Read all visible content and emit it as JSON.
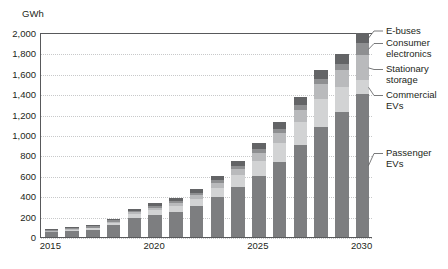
{
  "chart_data": {
    "type": "bar",
    "title": "",
    "subtitle": "",
    "xlabel": "",
    "ylabel": "GWh",
    "unit": "GWh",
    "stacked": true,
    "grid": true,
    "legend_position": "right-callout",
    "ylim": [
      0,
      2000
    ],
    "ytick_step": 200,
    "ytick_labels": [
      "0",
      "200",
      "400",
      "600",
      "800",
      "1,000",
      "1,200",
      "1,400",
      "1,600",
      "1,800",
      "2,000"
    ],
    "ytick_values": [
      0,
      200,
      400,
      600,
      800,
      1000,
      1200,
      1400,
      1600,
      1800,
      2000
    ],
    "categories": [
      "2015",
      "2016",
      "2017",
      "2018",
      "2019",
      "2020",
      "2021",
      "2022",
      "2023",
      "2024",
      "2025",
      "2026",
      "2027",
      "2028",
      "2029",
      "2030"
    ],
    "xtick_labels": [
      "2015",
      "2020",
      "2025",
      "2030"
    ],
    "xtick_categories": [
      "2015",
      "2020",
      "2025",
      "2030"
    ],
    "series": [
      {
        "name": "Passenger EVs",
        "color": "#7d7e80",
        "values": [
          45,
          58,
          72,
          115,
          185,
          215,
          245,
          300,
          390,
          490,
          600,
          740,
          900,
          1080,
          1230,
          1400
        ]
      },
      {
        "name": "Commercial EVs",
        "color": "#d2d3d4",
        "values": [
          8,
          10,
          12,
          20,
          40,
          50,
          60,
          75,
          95,
          120,
          150,
          185,
          230,
          275,
          240,
          135
        ]
      },
      {
        "name": "Stationary storage",
        "color": "#b9babc",
        "values": [
          6,
          7,
          9,
          12,
          16,
          20,
          26,
          35,
          45,
          60,
          75,
          95,
          120,
          145,
          170,
          245
        ]
      },
      {
        "name": "Consumer electronics",
        "color": "#8e8f91",
        "values": [
          10,
          12,
          14,
          16,
          18,
          20,
          22,
          24,
          26,
          30,
          35,
          40,
          45,
          50,
          55,
          120
        ]
      },
      {
        "name": "E-buses",
        "color": "#636466",
        "values": [
          6,
          8,
          10,
          14,
          20,
          25,
          30,
          35,
          42,
          50,
          58,
          68,
          78,
          90,
          100,
          100
        ]
      }
    ],
    "totals": [
      75,
      95,
      117,
      177,
      279,
      330,
      383,
      469,
      598,
      750,
      918,
      1128,
      1373,
      1640,
      1795,
      2000
    ],
    "annotations": [
      {
        "name": "e-buses",
        "text": "E-buses"
      },
      {
        "name": "consumer-electronics",
        "text": "Consumer\nelectronics"
      },
      {
        "name": "stationary-storage",
        "text": "Stationary\nstorage"
      },
      {
        "name": "commercial-evs",
        "text": "Commercial\nEVs"
      },
      {
        "name": "passenger-evs",
        "text": "Passenger\nEVs"
      }
    ]
  },
  "colors": {
    "axis": "#58595b",
    "gridline": "#c8c9ca",
    "text": "#231f20",
    "background": "#ffffff"
  }
}
